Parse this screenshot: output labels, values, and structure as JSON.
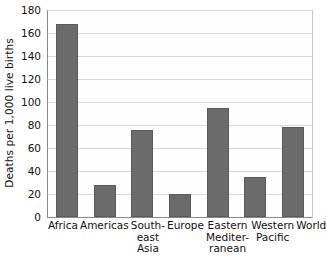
{
  "chart_data": {
    "type": "bar",
    "title": "",
    "subtitle": "",
    "xlabel": "",
    "ylabel": "Deaths per 1,000 live births",
    "ylim": [
      0,
      180
    ],
    "ytick_step": 20,
    "yticks": [
      180,
      160,
      140,
      120,
      100,
      80,
      60,
      40,
      20,
      0
    ],
    "ytick_labels": [
      "180",
      "160",
      "140",
      "120",
      "100",
      "80",
      "60",
      "40",
      "20",
      "0"
    ],
    "grid": true,
    "legend": false,
    "legend_position": "none",
    "bar_color": "#6b6b6b",
    "bar_edge_color": "#5a5a5a",
    "gridline_color": "#d8d8d8",
    "axis_color": "#8a8a8a",
    "categories": [
      "Africa",
      "Americas",
      "South-\neast\nAsia",
      "Europe",
      "Eastern\nMediter-\nranean",
      "Western\nPacific",
      "World"
    ],
    "category_names": [
      "Africa",
      "Americas",
      "South-east Asia",
      "Europe",
      "Eastern Mediterranean",
      "Western Pacific",
      "World"
    ],
    "values": [
      168,
      28,
      76,
      20,
      95,
      35,
      78
    ],
    "annotations": []
  }
}
